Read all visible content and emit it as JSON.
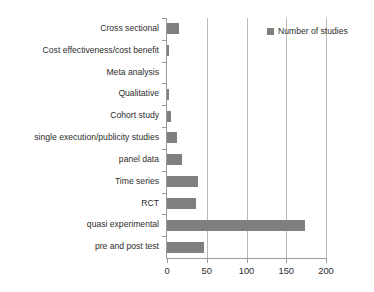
{
  "chart_data": {
    "type": "bar",
    "orientation": "horizontal",
    "title": "",
    "xlabel": "",
    "ylabel": "",
    "xlim": [
      0,
      200
    ],
    "xticks": [
      0,
      50,
      100,
      150,
      200
    ],
    "xtick_labels": [
      "0",
      "50",
      "100",
      "150",
      "200"
    ],
    "grid": true,
    "grid_axis": "x",
    "legend": {
      "position": "top-right",
      "entries": [
        {
          "label": "Number of studies",
          "color": "#7f7f7f"
        }
      ]
    },
    "series": [
      {
        "name": "Number of studies",
        "color": "#7f7f7f",
        "values": [
          15,
          3,
          0,
          3,
          5,
          13,
          19,
          39,
          36,
          173,
          46
        ]
      }
    ],
    "categories": [
      "Cross sectional",
      "Cost effectiveness/cost benefit",
      "Meta analysis",
      "Qualitative",
      "Cohort study",
      "single execution/publicity studies",
      "panel data",
      "Time series",
      "RCT",
      "quasi experimental",
      "pre and post test"
    ]
  }
}
